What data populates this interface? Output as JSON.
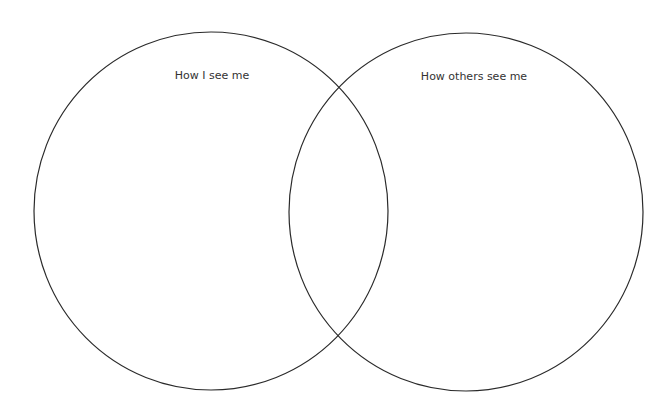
{
  "diagram": {
    "type": "venn",
    "stroke_color": "#2a2a2a",
    "background": "#ffffff",
    "sets": [
      {
        "label": "How I see me",
        "cx": 211,
        "cy": 211,
        "rx": 177,
        "ry": 179
      },
      {
        "label": "How others see me",
        "cx": 466,
        "cy": 212,
        "rx": 177,
        "ry": 179
      }
    ]
  }
}
